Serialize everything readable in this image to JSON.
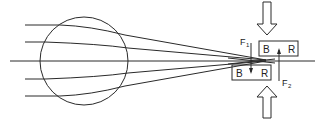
{
  "diagram": {
    "labels": {
      "upper_box_left": "B",
      "upper_box_right": "R",
      "lower_box_left": "B",
      "lower_box_right": "R",
      "force1": "F",
      "force1_sub": "1",
      "force2": "F",
      "force2_sub": "2"
    },
    "colors": {
      "stroke": "#2a2a2a",
      "background": "#ffffff"
    }
  }
}
